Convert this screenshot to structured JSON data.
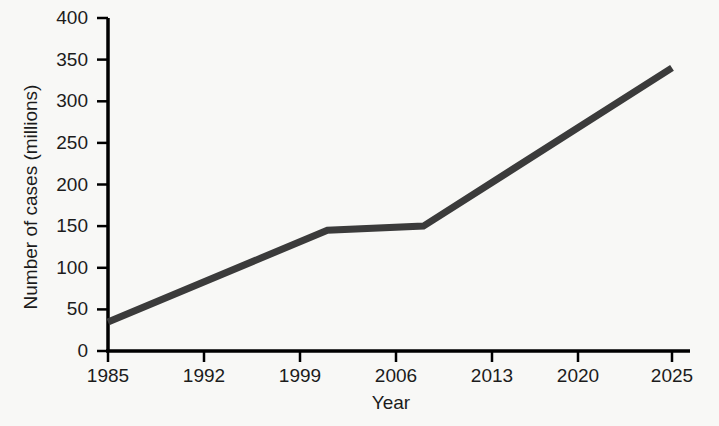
{
  "chart_data": {
    "type": "line",
    "title": "",
    "subtitle": "",
    "xlabel": "Year",
    "ylabel": "Number of cases (millions)",
    "x_tick_labels": [
      "1985",
      "1992",
      "1999",
      "2006",
      "2013",
      "2020",
      "2025"
    ],
    "y_tick_labels": [
      "0",
      "50",
      "100",
      "150",
      "200",
      "250",
      "300",
      "350",
      "400"
    ],
    "ylim": [
      0,
      400
    ],
    "y_tick_step": 50,
    "grid": false,
    "legend": null,
    "legend_position": "none",
    "annotations": [],
    "series": [
      {
        "name": "Number of cases",
        "x": [
          1985,
          2001,
          2008,
          2025
        ],
        "values": [
          35,
          145,
          150,
          340
        ],
        "color": "#3b3b3b",
        "line_width": 7,
        "markers": false
      }
    ],
    "x": [
      1985,
      2001,
      2008,
      2025
    ],
    "values": [
      35,
      145,
      150,
      340
    ]
  },
  "figure": {
    "background_color": "#f8f8f6",
    "axis_color": "#000000",
    "text_color": "#1c1c1c",
    "line_color": "#3b3b3b"
  }
}
